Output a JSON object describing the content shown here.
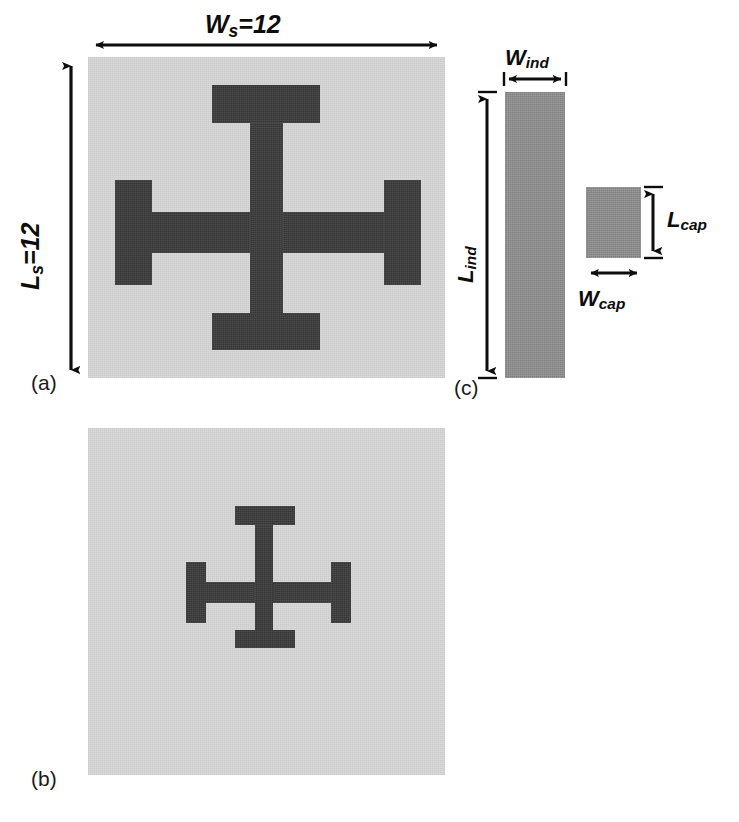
{
  "figure": {
    "panels": [
      {
        "id": "a",
        "tag": "(a)"
      },
      {
        "id": "b",
        "tag": "(b)"
      },
      {
        "id": "c",
        "tag": "(c)"
      }
    ]
  },
  "labels": {
    "w_s": {
      "symbol": "W",
      "sub": "s",
      "value": "=12",
      "full": "Ws=12"
    },
    "l_s": {
      "symbol": "L",
      "sub": "s",
      "value": "=12",
      "full": "Ls=12"
    },
    "w_ind": {
      "symbol": "W",
      "sub": "ind",
      "value": "",
      "full": "Wind"
    },
    "l_ind": {
      "symbol": "L",
      "sub": "ind",
      "value": "",
      "full": "Lind"
    },
    "w_cap": {
      "symbol": "W",
      "sub": "cap",
      "value": "",
      "full": "Wcap"
    },
    "l_cap": {
      "symbol": "L",
      "sub": "cap",
      "value": "",
      "full": "Lcap"
    }
  },
  "colors": {
    "substrate": "#d9d9d9",
    "metal_dark": "#3a3a3a",
    "metal_mid": "#8f8f8f",
    "line": "#0d0d0d",
    "background": "#ffffff"
  },
  "geometry": {
    "panel_a": {
      "substrate": {
        "x": 88,
        "y": 57,
        "w": 357,
        "h": 321
      },
      "cross": {
        "h_bar": {
          "x": 115,
          "y": 212,
          "w": 305,
          "h": 41
        },
        "v_stem": {
          "x": 250,
          "y": 85,
          "w": 33,
          "h": 265
        },
        "cap_top": {
          "x": 212,
          "y": 85,
          "w": 108,
          "h": 38
        },
        "cap_bot": {
          "x": 212,
          "y": 313,
          "w": 108,
          "h": 37
        },
        "cap_left": {
          "x": 115,
          "y": 180,
          "w": 37,
          "h": 105
        },
        "cap_right": {
          "x": 384,
          "y": 180,
          "w": 37,
          "h": 105
        }
      }
    },
    "panel_b": {
      "substrate": {
        "x": 88,
        "y": 428,
        "w": 357,
        "h": 347
      },
      "cross": {
        "h_bar": {
          "x": 186,
          "y": 582,
          "w": 165,
          "h": 21
        },
        "v_stem": {
          "x": 255,
          "y": 506,
          "w": 18,
          "h": 142
        },
        "cap_top": {
          "x": 235,
          "y": 506,
          "w": 60,
          "h": 19
        },
        "cap_bot": {
          "x": 235,
          "y": 630,
          "w": 60,
          "h": 18
        },
        "cap_left": {
          "x": 186,
          "y": 562,
          "w": 20,
          "h": 61
        },
        "cap_right": {
          "x": 331,
          "y": 562,
          "w": 20,
          "h": 61
        }
      }
    },
    "panel_c": {
      "inductor": {
        "x": 505,
        "y": 92,
        "w": 60,
        "h": 286
      },
      "capacitor": {
        "x": 586,
        "y": 187,
        "w": 55,
        "h": 71
      }
    }
  },
  "dimension_arrows": [
    {
      "name": "ws-arrow",
      "orientation": "horizontal",
      "x1": 90,
      "y1": 45,
      "x2": 443,
      "y2": 45,
      "heads": "both"
    },
    {
      "name": "ls-arrow",
      "orientation": "vertical",
      "x1": 71,
      "y1": 59,
      "x2": 71,
      "y2": 376,
      "heads": "both"
    },
    {
      "name": "wind-arrow",
      "orientation": "horizontal",
      "x1": 505,
      "y1": 78,
      "x2": 565,
      "y2": 78,
      "heads": "both"
    },
    {
      "name": "lind-arrow",
      "orientation": "vertical",
      "x1": 487,
      "y1": 92,
      "x2": 487,
      "y2": 378,
      "heads": "both"
    },
    {
      "name": "lcap-arrow",
      "orientation": "vertical",
      "x1": 653,
      "y1": 187,
      "x2": 653,
      "y2": 258,
      "heads": "both"
    },
    {
      "name": "wcap-arrow",
      "orientation": "horizontal",
      "x1": 586,
      "y1": 273,
      "x2": 641,
      "y2": 273,
      "heads": "both"
    }
  ]
}
